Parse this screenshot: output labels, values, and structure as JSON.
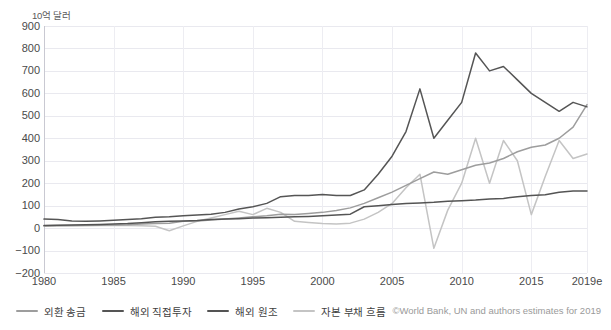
{
  "chart_data": {
    "type": "line",
    "title": "",
    "subtitle": "",
    "xlabel": "",
    "ylabel": "10억 달러",
    "y_unit_label": "10억 달러",
    "x": [
      1980,
      1981,
      1982,
      1983,
      1984,
      1985,
      1986,
      1987,
      1988,
      1989,
      1990,
      1991,
      1992,
      1993,
      1994,
      1995,
      1996,
      1997,
      1998,
      1999,
      2000,
      2001,
      2002,
      2003,
      2004,
      2005,
      2006,
      2007,
      2008,
      2009,
      2010,
      2011,
      2012,
      2013,
      2014,
      2015,
      2016,
      2017,
      2018,
      2019
    ],
    "xticks": [
      "1980",
      "1985",
      "1990",
      "1995",
      "2000",
      "2005",
      "2010",
      "2015",
      "2019e"
    ],
    "xtick_values": [
      1980,
      1985,
      1990,
      1995,
      2000,
      2005,
      2010,
      2015,
      2019
    ],
    "yticks": [
      -200,
      -100,
      0,
      100,
      200,
      300,
      400,
      500,
      600,
      700,
      800,
      900
    ],
    "ylim": [
      -200,
      900
    ],
    "xlim": [
      1980,
      2019
    ],
    "grid": true,
    "legend_position": "bottom-left",
    "series": [
      {
        "name": "외환 송금",
        "color": "#9d9d9d",
        "values": [
          10,
          11,
          12,
          13,
          13,
          14,
          15,
          18,
          20,
          22,
          30,
          32,
          36,
          40,
          45,
          50,
          55,
          62,
          60,
          65,
          70,
          78,
          90,
          110,
          135,
          160,
          190,
          220,
          250,
          240,
          260,
          280,
          290,
          310,
          340,
          360,
          370,
          400,
          450,
          550
        ]
      },
      {
        "name": "해외 직접투자",
        "color": "#555555",
        "values": [
          40,
          38,
          32,
          30,
          32,
          35,
          38,
          42,
          48,
          50,
          55,
          58,
          62,
          70,
          85,
          95,
          110,
          140,
          145,
          145,
          150,
          145,
          145,
          170,
          240,
          320,
          430,
          620,
          400,
          480,
          560,
          780,
          700,
          720,
          660,
          600,
          560,
          520,
          560,
          540
        ]
      },
      {
        "name": "해외 원조",
        "color": "#545454",
        "values": [
          12,
          13,
          14,
          15,
          16,
          18,
          20,
          24,
          28,
          30,
          32,
          34,
          38,
          40,
          42,
          45,
          46,
          48,
          50,
          52,
          55,
          58,
          62,
          95,
          100,
          105,
          110,
          112,
          115,
          120,
          122,
          125,
          130,
          132,
          140,
          145,
          148,
          160,
          165,
          165
        ]
      },
      {
        "name": "자본 부채 흐름",
        "color": "#c4c4c4",
        "values": [
          8,
          9,
          10,
          10,
          11,
          12,
          12,
          10,
          8,
          -12,
          10,
          30,
          45,
          60,
          75,
          60,
          88,
          70,
          30,
          25,
          20,
          18,
          22,
          40,
          70,
          110,
          180,
          240,
          -90,
          80,
          200,
          400,
          200,
          390,
          300,
          60,
          230,
          390,
          310,
          330
        ]
      }
    ]
  },
  "legend": {
    "items": [
      {
        "label": "외환 송금",
        "color": "#9d9d9d"
      },
      {
        "label": "해외 직접투자",
        "color": "#555555"
      },
      {
        "label": "해외 원조",
        "color": "#545454"
      },
      {
        "label": "자본 부채 흐름",
        "color": "#c4c4c4"
      }
    ]
  },
  "credit": {
    "text": "©World Bank, UN and authors estimates for 2019"
  }
}
